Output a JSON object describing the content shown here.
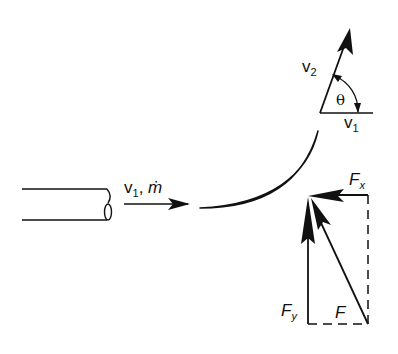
{
  "diagram": {
    "type": "fluid-jet-on-curved-vane",
    "colors": {
      "ink": "#111111",
      "background": "#ffffff"
    },
    "jet": {
      "label_v": "v",
      "label_v_sub": "1",
      "label_sep": ", ",
      "label_mdot": "ṁ"
    },
    "velocity_triangle": {
      "v2_label": "v",
      "v2_sub": "2",
      "v1_label": "v",
      "v1_sub": "1",
      "angle_label": "θ"
    },
    "force_diagram": {
      "fx_label": "F",
      "fx_sub": "x",
      "fy_label": "F",
      "fy_sub": "y",
      "f_label": "F"
    }
  }
}
